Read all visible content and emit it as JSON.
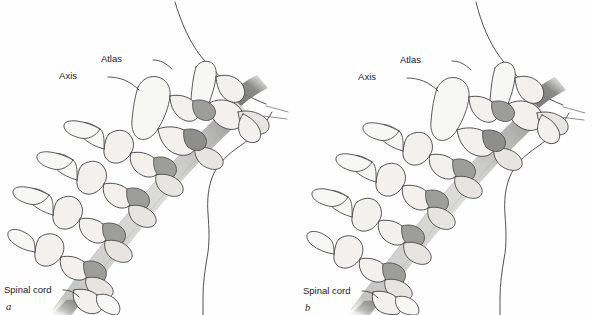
{
  "figure": {
    "background_color": "#ffffff",
    "panel_count": 2
  },
  "colors": {
    "bone_fill": "#f2f1ee",
    "bone_fill_light": "#f7f7f5",
    "bone_fill_shadow": "#e6e5e1",
    "bone_outline": "#4a4a4a",
    "disc_grey": "#9d9d99",
    "disc_grey_dark": "#8e8e8a",
    "cord_grey": "#b5b5b3",
    "cord_grey_dark": "#7f7f7d",
    "skin_outline": "#3d3d3d",
    "label_text": "#1b1b1b"
  },
  "panels": [
    {
      "id": "a",
      "letter": "a",
      "labels": [
        {
          "name": "atlas",
          "text": "Atlas"
        },
        {
          "name": "axis",
          "text": "Axis"
        },
        {
          "name": "spinal-cord",
          "text": "Spinal cord"
        }
      ]
    },
    {
      "id": "b",
      "letter": "b",
      "labels": [
        {
          "name": "atlas",
          "text": "Atlas"
        },
        {
          "name": "axis",
          "text": "Axis"
        },
        {
          "name": "spinal-cord",
          "text": "Spinal cord"
        }
      ]
    }
  ]
}
